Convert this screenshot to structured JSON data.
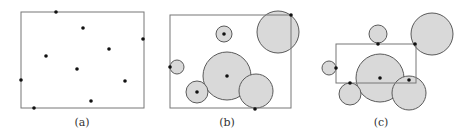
{
  "colors": {
    "circle_fill": "#d9d9d9",
    "circle_stroke": "#5a5a5a",
    "rect_stroke": "#777777",
    "point": "#111111",
    "caption": "#333333"
  },
  "panels": [
    {
      "label": "(a)",
      "label_pos": [
        82,
        124
      ],
      "rect": {
        "x": 21,
        "y": 12,
        "w": 123,
        "h": 96
      },
      "circles": [],
      "points": [
        [
          56,
          12
        ],
        [
          83,
          28
        ],
        [
          143,
          39
        ],
        [
          109,
          49
        ],
        [
          46,
          56
        ],
        [
          77,
          69
        ],
        [
          21,
          80
        ],
        [
          125,
          81
        ],
        [
          91,
          101
        ],
        [
          34,
          108
        ]
      ]
    },
    {
      "label": "(b)",
      "label_pos": [
        227,
        124
      ],
      "rect": {
        "x": 170,
        "y": 15,
        "w": 121,
        "h": 93
      },
      "circles": [
        {
          "cx": 278,
          "cy": 32,
          "r": 21
        },
        {
          "cx": 224,
          "cy": 34,
          "r": 8
        },
        {
          "cx": 177,
          "cy": 67,
          "r": 7
        },
        {
          "cx": 227,
          "cy": 76,
          "r": 24
        },
        {
          "cx": 197,
          "cy": 92,
          "r": 11
        },
        {
          "cx": 256,
          "cy": 91,
          "r": 17
        }
      ],
      "points": [
        [
          291,
          15
        ],
        [
          224,
          34
        ],
        [
          170,
          67
        ],
        [
          227,
          76
        ],
        [
          197,
          92
        ],
        [
          255,
          109
        ]
      ]
    },
    {
      "label": "(c)",
      "label_pos": [
        381,
        124
      ],
      "rect": {
        "x": 336,
        "y": 44,
        "w": 80,
        "h": 39
      },
      "circles": [
        {
          "cx": 432,
          "cy": 34,
          "r": 21
        },
        {
          "cx": 378,
          "cy": 34,
          "r": 9
        },
        {
          "cx": 329,
          "cy": 68,
          "r": 7
        },
        {
          "cx": 380,
          "cy": 78,
          "r": 24
        },
        {
          "cx": 350,
          "cy": 94,
          "r": 11
        },
        {
          "cx": 409,
          "cy": 93,
          "r": 17
        }
      ],
      "points": [
        [
          415,
          44
        ],
        [
          378,
          44
        ],
        [
          336,
          68
        ],
        [
          380,
          78
        ],
        [
          350,
          83
        ],
        [
          409,
          80
        ]
      ]
    }
  ]
}
